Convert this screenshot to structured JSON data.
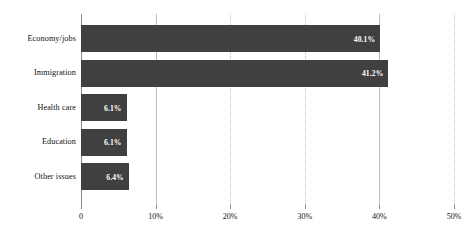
{
  "chart_data": {
    "type": "bar",
    "orientation": "horizontal",
    "title": "",
    "subtitle": "",
    "xlabel": "",
    "ylabel": "",
    "categories": [
      "Economy/jobs",
      "Immigration",
      "Health care",
      "Education",
      "Other issues"
    ],
    "values": [
      40.1,
      41.2,
      6.1,
      6.1,
      6.4
    ],
    "value_labels": [
      "40.1%",
      "41.2%",
      "6.1%",
      "6.1%",
      "6.4%"
    ],
    "xlim": [
      0,
      50
    ],
    "x_ticks": [
      0,
      10,
      20,
      30,
      40,
      50
    ],
    "x_tick_labels": [
      "0",
      "10%",
      "20%",
      "30%",
      "40%",
      "50%"
    ],
    "grid": true,
    "grid_axis": "x",
    "legend": false,
    "legend_position": "none",
    "bar_color": "#404040",
    "value_label_color": "#ffffff",
    "gridline_color": "#bdbdbd",
    "axis_color": "#8a8a8a",
    "text_color": "#111111",
    "background_color": "#ffffff"
  }
}
